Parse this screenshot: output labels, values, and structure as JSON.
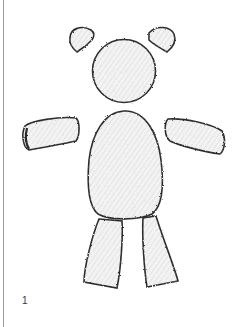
{
  "page": {
    "number": "1"
  },
  "figure": {
    "parts": [
      "left-ear",
      "right-ear",
      "head",
      "left-arm",
      "right-arm",
      "body",
      "left-leg",
      "right-leg"
    ],
    "stroke_color": "#2a2a2a",
    "fill_color": "#f4f4f4"
  }
}
